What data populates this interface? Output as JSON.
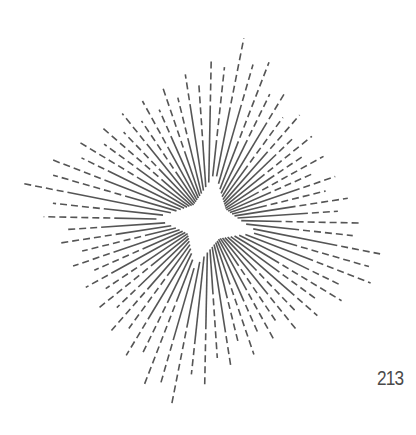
{
  "page": {
    "page_number": "213",
    "background": "#ffffff"
  },
  "illustration": {
    "name": "starburst",
    "stroke_color": "#555555",
    "stroke_width": 1.6,
    "center": [
      208,
      220
    ],
    "outer_corners": [
      [
        252,
        33
      ],
      [
        390,
        271
      ],
      [
        160,
        412
      ],
      [
        20,
        177
      ]
    ],
    "inner_star_points": [
      [
        215,
        175
      ],
      [
        256,
        232
      ],
      [
        195,
        266
      ],
      [
        157,
        218
      ]
    ],
    "inner_star_depth": 0.55,
    "ray_count": 72,
    "solid_fraction_min": 0.35,
    "solid_fraction_max": 0.75,
    "dash": [
      7,
      4
    ]
  }
}
